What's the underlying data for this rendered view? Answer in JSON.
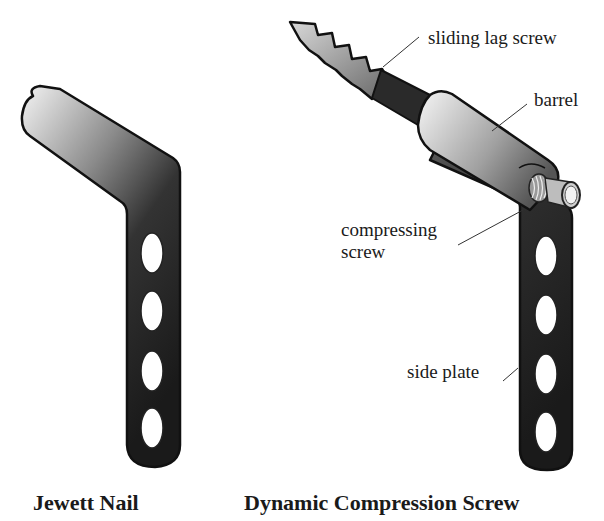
{
  "figure": {
    "left_device": {
      "caption": "Jewett Nail",
      "hole_count": 4
    },
    "right_device": {
      "caption": "Dynamic Compression Screw",
      "hole_count": 4,
      "labels": {
        "lag_screw": "sliding lag screw",
        "barrel": "barrel",
        "compressing_line1": "compressing",
        "compressing_line2": "screw",
        "side_plate": "side plate"
      }
    }
  },
  "colors": {
    "background": "#ffffff",
    "metal_light": "#f2f2f2",
    "metal_dark": "#1e1e1e",
    "outline": "#111111",
    "hole_fill": "#ffffff"
  }
}
